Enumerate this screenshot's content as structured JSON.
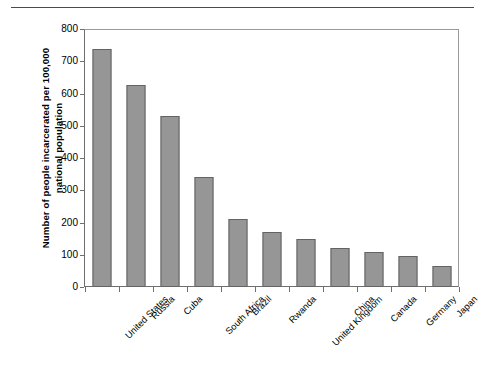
{
  "chart_data": {
    "type": "bar",
    "title": "",
    "xlabel": "",
    "ylabel": "Number of people incarcerated per 100,000 national population",
    "ylabel_lines": [
      "Number of people incarcerated per 100,000",
      "national population"
    ],
    "ylim": [
      0,
      800
    ],
    "ytick_values": [
      0,
      100,
      200,
      300,
      400,
      500,
      600,
      700,
      800
    ],
    "ytick_labels": [
      "0",
      "100",
      "200",
      "300",
      "400",
      "500",
      "600",
      "700",
      "800"
    ],
    "grid": false,
    "legend": null,
    "categories": [
      "United States",
      "Russia",
      "Cuba",
      "South Africa",
      "Brazil",
      "Rwanda",
      "United Kingdom",
      "China",
      "Canada",
      "Germany",
      "Japan"
    ],
    "values": [
      737,
      625,
      530,
      340,
      210,
      172,
      150,
      120,
      110,
      95,
      65
    ],
    "bar_color": "#969696",
    "bar_edge_color": "#636363",
    "axis_color": "#6f6f6f",
    "background_color": "#ffffff"
  },
  "figure": {
    "top_rule": true
  }
}
